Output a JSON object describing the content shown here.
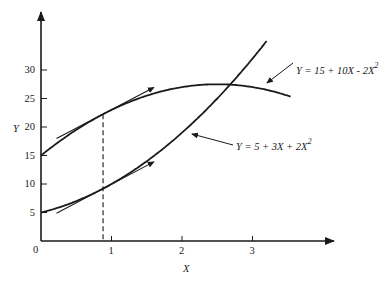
{
  "chart_data": {
    "type": "line",
    "title": "",
    "xlabel": "X",
    "ylabel": "Y",
    "xlim": [
      0,
      3.6
    ],
    "ylim": [
      0,
      36
    ],
    "grid": false,
    "x_ticks": [
      "1",
      "2",
      "3"
    ],
    "y_ticks": [
      "5",
      "10",
      "15",
      "20",
      "25",
      "30"
    ],
    "origin_label": "0",
    "series": [
      {
        "name": "Y = 15 + 10X - 2X²",
        "equation": {
          "a": 15,
          "b": 10,
          "c": -2
        },
        "x_range": [
          0,
          3.55
        ],
        "label": "Y = 15 + 10X - 2X",
        "label_sup": "2"
      },
      {
        "name": "Y = 5 + 3X + 2X²",
        "equation": {
          "a": 5,
          "b": 3,
          "c": 2
        },
        "x_range": [
          0,
          3.2
        ],
        "label": "Y = 5 + 3X + 2X",
        "label_sup": "2"
      }
    ],
    "annotations": {
      "tangent_point_x": 0.88,
      "dashed_vertical_at_x": 0.88,
      "tangent_lines": "Tangent arrows drawn at X ≈ 0.88 on both curves, showing equal slopes"
    }
  },
  "axis": {
    "x_label": "X",
    "y_label": "Y",
    "origin": "0",
    "x_ticks": [
      {
        "v": 1,
        "t": "1"
      },
      {
        "v": 2,
        "t": "2"
      },
      {
        "v": 3,
        "t": "3"
      }
    ],
    "y_ticks": [
      {
        "v": 5,
        "t": "5"
      },
      {
        "v": 10,
        "t": "10"
      },
      {
        "v": 15,
        "t": "15"
      },
      {
        "v": 20,
        "t": "20"
      },
      {
        "v": 25,
        "t": "25"
      },
      {
        "v": 30,
        "t": "30"
      }
    ]
  },
  "labels": {
    "upper_curve": "Y = 15 + 10X - 2X",
    "lower_curve": "Y = 5 + 3X + 2X",
    "sup": "2"
  },
  "colors": {
    "ink": "#1a1a1a",
    "background": "#ffffff"
  }
}
